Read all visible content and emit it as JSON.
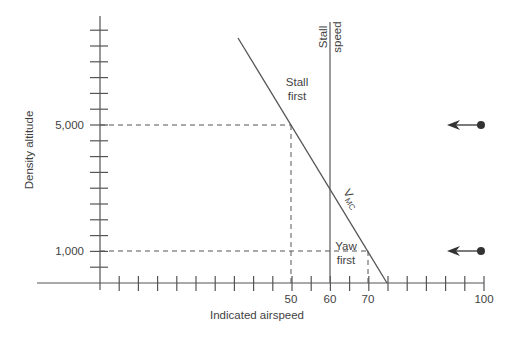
{
  "chart_data": {
    "type": "line",
    "title": "",
    "xlabel": "Indicated airspeed",
    "ylabel": "Density altitude",
    "xlim": [
      0,
      100
    ],
    "ylim": [
      0,
      8000
    ],
    "x_tick_step": 5,
    "y_tick_step": 500,
    "x_tick_labels": [
      {
        "value": 50,
        "label": "50"
      },
      {
        "value": 60,
        "label": "60"
      },
      {
        "value": 70,
        "label": "70"
      },
      {
        "value": 100,
        "label": "100"
      }
    ],
    "y_tick_labels": [
      {
        "value": 5000,
        "label": "5,000"
      },
      {
        "value": 1000,
        "label": "1,000"
      }
    ],
    "grid": false,
    "series": [
      {
        "name": "VMC",
        "label_main": "V",
        "label_sub": "MC",
        "points": [
          {
            "x": 36,
            "y": 7750
          },
          {
            "x": 75,
            "y": 0
          }
        ]
      },
      {
        "name": "Stall speed",
        "label_line1": "Stall",
        "label_line2": "speed",
        "points": [
          {
            "x": 60,
            "y": 0
          },
          {
            "x": 60,
            "y": 8400
          }
        ]
      }
    ],
    "reference_lines": [
      {
        "name": "5,000 ft case",
        "altitude": 5000,
        "airspeed": 50
      },
      {
        "name": "1,000 ft case",
        "altitude": 1000,
        "airspeed": 70
      }
    ],
    "annotations": [
      {
        "text_line1": "Stall",
        "text_line2": "first",
        "region": "above intersection"
      },
      {
        "text_line1": "Yaw",
        "text_line2": "first",
        "region": "below intersection"
      }
    ],
    "arrows": [
      {
        "altitude": 5000,
        "from_x": 100,
        "direction": "left"
      },
      {
        "altitude": 1000,
        "from_x": 100,
        "direction": "left"
      }
    ]
  }
}
